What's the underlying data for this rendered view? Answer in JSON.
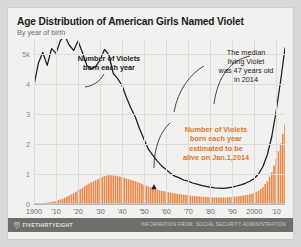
{
  "header": {
    "title": "Age Distribution of American Girls Named Violet",
    "subtitle": "By year of birth"
  },
  "footer": {
    "logo_text": "FIVETHIRTYEIGHT",
    "logo_icon": "fivethirtyeight-logo-icon",
    "credit": "INFORMATION FROM: SOCIAL SECURITY ADMINISTRATION"
  },
  "annotations": {
    "births": {
      "line1": "Number of Violets",
      "line2": "born each year"
    },
    "median": {
      "line1": "The median",
      "line2": "living Violet",
      "line3": "was 47 years old",
      "line4": "in 2014"
    },
    "alive": {
      "line1": "Number of Violets",
      "line2": "born each year",
      "line3": "estimated to be",
      "line4": "alive on Jan.1,2014"
    }
  },
  "colors": {
    "orange": "#e8894a",
    "orange_text": "#e2742a",
    "line": "#1b1b1b",
    "grid": "#dedcd8",
    "card_bg": "#f2f1ef",
    "footer_bg": "#6f6e6b"
  },
  "chart_data": {
    "type": "area",
    "title": "Age Distribution of American Girls Named Violet",
    "subtitle": "By year of birth",
    "xlabel": "",
    "ylabel": "",
    "xlim": [
      1900,
      2014
    ],
    "ylim": [
      0,
      5500
    ],
    "grid": true,
    "legend": "none",
    "ytick_values": [
      0,
      1000,
      2000,
      3000,
      4000,
      5000
    ],
    "ytick_labels": [
      "0",
      "1",
      "2",
      "3",
      "4",
      "5k"
    ],
    "xtick_values": [
      1900,
      1910,
      1920,
      1930,
      1940,
      1950,
      1960,
      1970,
      1980,
      1990,
      2000,
      2010
    ],
    "xtick_labels": [
      "1900",
      "'10",
      "'20",
      "'30",
      "'40",
      "'50",
      "'60",
      "'70",
      "'80",
      "'90",
      "2000",
      "'10"
    ],
    "series": [
      {
        "name": "Number of Violets born each year",
        "style": "line",
        "color": "#1b1b1b",
        "x": [
          1900,
          1902,
          1904,
          1906,
          1908,
          1910,
          1912,
          1914,
          1916,
          1918,
          1920,
          1922,
          1924,
          1926,
          1928,
          1930,
          1932,
          1934,
          1936,
          1938,
          1940,
          1942,
          1944,
          1946,
          1948,
          1950,
          1952,
          1954,
          1956,
          1958,
          1960,
          1962,
          1964,
          1966,
          1968,
          1970,
          1972,
          1974,
          1976,
          1978,
          1980,
          1982,
          1984,
          1986,
          1988,
          1990,
          1992,
          1994,
          1996,
          1998,
          2000,
          2002,
          2004,
          2006,
          2008,
          2010,
          2012,
          2014
        ],
        "values": [
          3950,
          4700,
          5050,
          4620,
          5180,
          5020,
          5450,
          5600,
          5300,
          5120,
          5430,
          5050,
          4620,
          4500,
          4580,
          4800,
          5150,
          4980,
          4350,
          4180,
          3950,
          3550,
          3200,
          2900,
          2500,
          2150,
          1820,
          1620,
          1430,
          1270,
          1150,
          1020,
          930,
          870,
          800,
          760,
          700,
          660,
          620,
          590,
          560,
          540,
          530,
          520,
          540,
          560,
          600,
          640,
          690,
          760,
          850,
          1000,
          1250,
          1650,
          2250,
          3100,
          4100,
          5200
        ]
      },
      {
        "name": "Number of Violets born each year estimated to be alive on Jan.1,2014",
        "style": "bars",
        "color": "#e8894a",
        "x": [
          1900,
          1902,
          1904,
          1906,
          1908,
          1910,
          1912,
          1914,
          1916,
          1918,
          1920,
          1922,
          1924,
          1926,
          1928,
          1930,
          1932,
          1934,
          1936,
          1938,
          1940,
          1942,
          1944,
          1946,
          1948,
          1950,
          1952,
          1954,
          1956,
          1958,
          1960,
          1962,
          1964,
          1966,
          1968,
          1970,
          1972,
          1974,
          1976,
          1978,
          1980,
          1982,
          1984,
          1986,
          1988,
          1990,
          1992,
          1994,
          1996,
          1998,
          2000,
          2002,
          2004,
          2006,
          2008,
          2010,
          2012,
          2014
        ],
        "values": [
          10,
          20,
          30,
          45,
          70,
          100,
          150,
          210,
          280,
          360,
          450,
          540,
          640,
          720,
          790,
          860,
          930,
          960,
          950,
          930,
          900,
          850,
          800,
          760,
          700,
          640,
          580,
          530,
          480,
          440,
          410,
          380,
          350,
          330,
          310,
          290,
          270,
          255,
          245,
          235,
          225,
          220,
          215,
          212,
          225,
          235,
          250,
          270,
          295,
          325,
          370,
          440,
          560,
          760,
          1060,
          1500,
          2020,
          2650
        ]
      }
    ],
    "annotations": [
      {
        "text": "Number of Violets born each year",
        "target_year": 1918,
        "color": "#1b1b1b"
      },
      {
        "text": "The median living Violet was 47 years old in 2014",
        "target_year": 1967,
        "color": "#1b1b1b"
      },
      {
        "text": "Number of Violets born each year estimated to be alive on Jan.1,2014",
        "target_year": 1970,
        "color": "#e2742a"
      }
    ]
  }
}
